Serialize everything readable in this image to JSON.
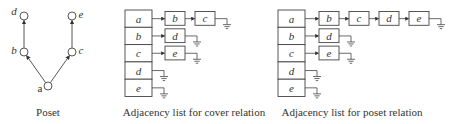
{
  "poset": {
    "caption": "Poset",
    "nodes": [
      {
        "id": "a",
        "label": "a",
        "x": 48,
        "y": 86
      },
      {
        "id": "b",
        "label": "b",
        "x": 24,
        "y": 52
      },
      {
        "id": "c",
        "label": "c",
        "x": 72,
        "y": 52
      },
      {
        "id": "d",
        "label": "d",
        "x": 24,
        "y": 16
      },
      {
        "id": "e",
        "label": "e",
        "x": 72,
        "y": 16
      }
    ],
    "edges": [
      [
        "a",
        "b"
      ],
      [
        "a",
        "c"
      ],
      [
        "b",
        "d"
      ],
      [
        "c",
        "e"
      ]
    ]
  },
  "cover_list": {
    "caption": "Adjacency list for cover relation",
    "heads": [
      "a",
      "b",
      "c",
      "d",
      "e"
    ],
    "lists": {
      "a": [
        "b",
        "c"
      ],
      "b": [
        "d"
      ],
      "c": [
        "e"
      ],
      "d": [],
      "e": []
    }
  },
  "poset_list": {
    "caption": "Adjacency list for poset relation",
    "heads": [
      "a",
      "b",
      "c",
      "d",
      "e"
    ],
    "lists": {
      "a": [
        "b",
        "c",
        "d",
        "e"
      ],
      "b": [
        "d"
      ],
      "c": [
        "e"
      ],
      "d": [],
      "e": []
    }
  }
}
